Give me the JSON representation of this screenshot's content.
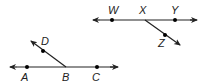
{
  "diagram": {
    "colors": {
      "stroke": "#222222",
      "background": "#ffffff"
    },
    "top_figure": {
      "line_points": [
        "W",
        "X",
        "Y"
      ],
      "ray": {
        "from": "X",
        "through": "Z"
      },
      "labels": {
        "W": "W",
        "X": "X",
        "Y": "Y",
        "Z": "Z"
      }
    },
    "bottom_figure": {
      "line_points": [
        "A",
        "B",
        "C"
      ],
      "ray": {
        "from": "B",
        "through": "D"
      },
      "labels": {
        "A": "A",
        "B": "B",
        "C": "C",
        "D": "D"
      }
    }
  }
}
